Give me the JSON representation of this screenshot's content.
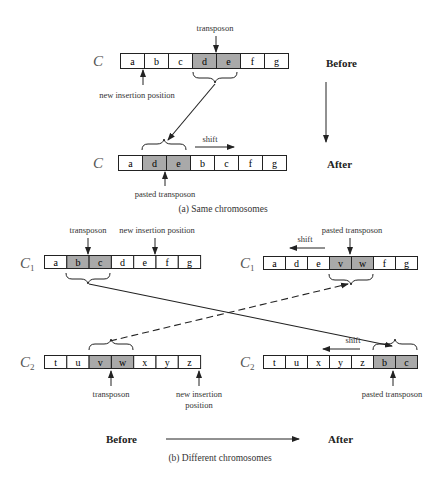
{
  "colors": {
    "cell_fill": "#ffffff",
    "transposon_fill": "#a9a9a9",
    "stroke": "#222222"
  },
  "part_a": {
    "caption": "(a) Same chromosomes",
    "before_label": "Before",
    "after_label": "After",
    "before": {
      "chromosome": "C",
      "cells": [
        "a",
        "b",
        "c",
        "d",
        "e",
        "f",
        "g"
      ],
      "highlighted": [
        3,
        4
      ],
      "annotations": {
        "top": "transposon",
        "bottom": "new insertion position"
      }
    },
    "after": {
      "chromosome": "C",
      "cells": [
        "a",
        "d",
        "e",
        "b",
        "c",
        "f",
        "g"
      ],
      "highlighted": [
        1,
        2
      ],
      "annotations": {
        "shift": "shift",
        "bottom": "pasted transposon"
      }
    }
  },
  "part_b": {
    "caption": "(b) Different chromosomes",
    "before_label": "Before",
    "after_label": "After",
    "before_c1": {
      "chromosome": "C",
      "subscript": "1",
      "cells": [
        "a",
        "b",
        "c",
        "d",
        "e",
        "f",
        "g"
      ],
      "highlighted": [
        1,
        2
      ],
      "annotations": {
        "transposon": "transposon",
        "insertion": "new insertion position"
      }
    },
    "before_c2": {
      "chromosome": "C",
      "subscript": "2",
      "cells": [
        "t",
        "u",
        "v",
        "w",
        "x",
        "y",
        "z"
      ],
      "highlighted": [
        2,
        3
      ],
      "annotations": {
        "transposon": "transposon",
        "insertion_line1": "new insertion",
        "insertion_line2": "position"
      }
    },
    "after_c1": {
      "chromosome": "C",
      "subscript": "1",
      "cells": [
        "a",
        "d",
        "e",
        "v",
        "w",
        "f",
        "g"
      ],
      "highlighted": [
        3,
        4
      ],
      "annotations": {
        "shift": "shift",
        "pasted": "pasted transposon"
      }
    },
    "after_c2": {
      "chromosome": "C",
      "subscript": "2",
      "cells": [
        "t",
        "u",
        "x",
        "y",
        "z",
        "b",
        "c"
      ],
      "highlighted": [
        5,
        6
      ],
      "annotations": {
        "shift": "shift",
        "pasted": "pasted transposon"
      }
    }
  }
}
